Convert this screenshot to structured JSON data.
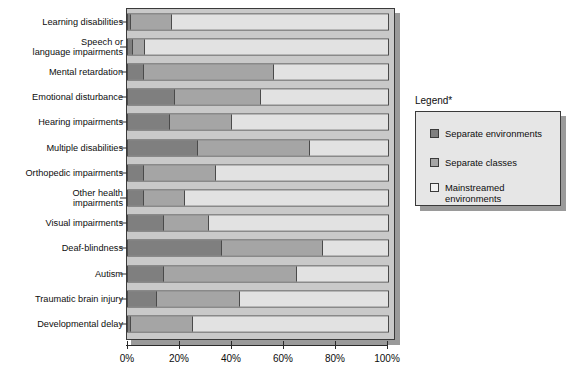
{
  "chart_data": {
    "type": "bar",
    "orientation": "horizontal",
    "stacked": true,
    "title": "",
    "xlabel": "",
    "ylabel": "",
    "xlim": [
      0,
      100
    ],
    "xticks": [
      "0%",
      "20%",
      "40%",
      "60%",
      "80%",
      "100%"
    ],
    "xtick_values": [
      0,
      20,
      40,
      60,
      80,
      100
    ],
    "grid": false,
    "legend_position": "right",
    "categories": [
      "Learning disabilities",
      "Speech or\nlanguage impairments",
      "Mental retardation",
      "Emotional disturbance",
      "Hearing impairments",
      "Multiple disabilities",
      "Orthopedic impairments",
      "Other health\nimpairments",
      "Visual impairments",
      "Deaf-blindness",
      "Autism",
      "Traumatic brain injury",
      "Developmental delay"
    ],
    "series": [
      {
        "name": "Separate environments",
        "color": "#7f7f7f",
        "values": [
          1,
          2,
          6,
          18,
          16,
          27,
          6,
          6,
          14,
          36,
          14,
          11,
          1
        ]
      },
      {
        "name": "Separate classes",
        "color": "#a5a5a5",
        "values": [
          16,
          4.5,
          50,
          33,
          24,
          43,
          28,
          16,
          17,
          39,
          51,
          32,
          24
        ]
      },
      {
        "name": "Mainstreamed environments",
        "color": "#e2e2e2",
        "values": [
          83,
          93.5,
          44,
          49,
          60,
          30,
          66,
          78,
          69,
          25,
          35,
          57,
          75
        ]
      }
    ]
  },
  "legend": {
    "title": "Legend*",
    "items": [
      {
        "label": "Separate environments",
        "swatch": "#7f7f7f"
      },
      {
        "label": "Separate classes",
        "swatch": "#a5a5a5"
      },
      {
        "label": "Mainstreamed\nenvironments",
        "swatch": "#f2f2f2"
      }
    ]
  }
}
